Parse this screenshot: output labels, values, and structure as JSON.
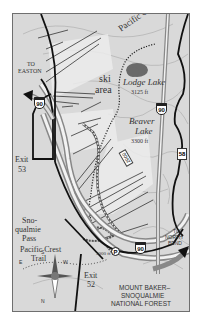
{
  "map": {
    "colors": {
      "background": "#d9d9d9",
      "frame_border": "#6f6f6f",
      "highway": "#111111",
      "trail": "#333333",
      "lake": "#6a6a6a",
      "contour": "#a8a8a8",
      "ski_run_light": "#ececec"
    },
    "labels": {
      "pacific_crest_trail_north": "Pacific Crest Trail",
      "lodge_lake_name": "Lodge Lake",
      "lodge_lake_elev": "3125 ft",
      "beaver_lake_name": "Beaver",
      "beaver_lake_name2": "Lake",
      "beaver_lake_elev": "3300 ft",
      "ski_area_1": "ski",
      "ski_area_2": "area",
      "to_easton_1": "TO",
      "to_easton_2": "EASTON",
      "exit_53_1": "Exit",
      "exit_53_2": "53",
      "exit_52_1": "Exit",
      "exit_52_2": "52",
      "snoqualmie_pass_1": "Sno-",
      "snoqualmie_pass_2": "qualmie",
      "snoqualmie_pass_3": "Pass",
      "pct_south_1": "Pacific Crest",
      "pct_south_2": "Trail",
      "to_north_bend_1": "TO",
      "to_north_bend_2": "NORTH",
      "to_north_bend_3": "BEND",
      "elev_3000": "3000 ft",
      "forest_1": "MOUNT BAKER–",
      "forest_2": "SNOQUALMIE",
      "forest_3": "NATIONAL FOREST"
    },
    "signs": {
      "i90_a": "90",
      "i90_b": "90",
      "i90_c": "90",
      "sr58": "58",
      "road_2000": "2000",
      "parking": "P"
    },
    "compass": {
      "north": "N",
      "south": "S",
      "east": "E",
      "west": "W"
    }
  }
}
